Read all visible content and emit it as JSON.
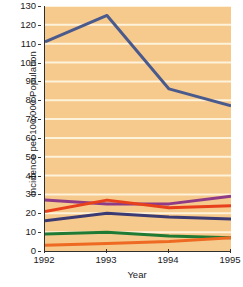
{
  "chart_data": {
    "type": "line",
    "title": "",
    "xlabel": "Year",
    "ylabel": "Incidence per 100,000 Population",
    "x": [
      "1992",
      "1993",
      "1994",
      "1995"
    ],
    "xtick_labels": [
      "1992",
      "1993",
      "1994",
      "1995"
    ],
    "ytick_labels": [
      "0",
      "10",
      "20",
      "30",
      "40",
      "50",
      "60",
      "70",
      "80",
      "90",
      "100",
      "110",
      "120",
      "130"
    ],
    "ytick_values": [
      0,
      10,
      20,
      30,
      40,
      50,
      60,
      70,
      80,
      90,
      100,
      110,
      120,
      130
    ],
    "ylim": [
      0,
      130
    ],
    "xlim": [
      "1992",
      "1995"
    ],
    "grid": true,
    "grid_color": "#fdf2da",
    "plot_background": "#f6c98d",
    "legend": "none",
    "series": [
      {
        "name": "series-1",
        "color": "#4a5a8c",
        "values": [
          111,
          125,
          86,
          77
        ]
      },
      {
        "name": "series-2",
        "color": "#8e3a86",
        "values": [
          27,
          25,
          25,
          29
        ]
      },
      {
        "name": "series-3",
        "color": "#e8401a",
        "values": [
          21,
          27,
          23,
          24
        ]
      },
      {
        "name": "series-4",
        "color": "#3b3a72",
        "values": [
          16,
          20,
          18,
          17
        ]
      },
      {
        "name": "series-5",
        "color": "#1f7a34",
        "values": [
          9,
          10,
          8,
          7
        ]
      },
      {
        "name": "series-6",
        "color": "#ee6a22",
        "values": [
          3,
          4,
          5,
          7
        ]
      }
    ]
  }
}
